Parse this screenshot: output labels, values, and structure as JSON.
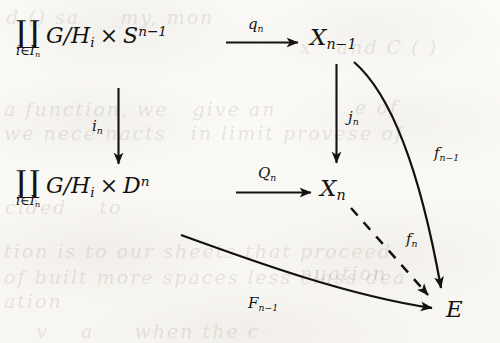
{
  "figure": {
    "kind": "commutative-diagram",
    "background_color": "#fbfaf7",
    "ink_color": "#14120f"
  },
  "nodes": [
    {
      "id": "top-left",
      "name": "node-coproduct-sphere",
      "coproduct_symbol": "∐",
      "coproduct_index": "i∈Iₙ",
      "index_base": "i∈I",
      "index_sub": "n",
      "body_main": "G/H",
      "body_sub": "i",
      "times": "×",
      "space": "S",
      "space_sup": "n−1",
      "text": "∐ i∈Iₙ G/Hᵢ × Sⁿ⁻¹"
    },
    {
      "id": "top-right",
      "name": "node-x-n-minus-1",
      "base": "X",
      "sub": "n−1",
      "text": "Xₙ₋₁"
    },
    {
      "id": "bottom-left",
      "name": "node-coproduct-disk",
      "coproduct_symbol": "∐",
      "coproduct_index": "i∈Iₙ",
      "index_base": "i∈I",
      "index_sub": "n",
      "body_main": "G/H",
      "body_sub": "i",
      "times": "×",
      "space": "D",
      "space_sup": "n",
      "text": "∐ i∈Iₙ G/Hᵢ × Dⁿ"
    },
    {
      "id": "bottom-right",
      "name": "node-x-n",
      "base": "X",
      "sub": "n",
      "text": "Xₙ"
    },
    {
      "id": "target",
      "name": "node-e",
      "base": "E",
      "text": "E"
    }
  ],
  "arrows": [
    {
      "id": "q-n",
      "name": "arrow-q-n",
      "from": "top-left",
      "to": "top-right",
      "style": "solid",
      "shape": "straight",
      "label_base": "q",
      "label_sub": "n",
      "label": "qₙ"
    },
    {
      "id": "i-n",
      "name": "arrow-i-n",
      "from": "top-left",
      "to": "bottom-left",
      "style": "solid",
      "shape": "straight",
      "label_base": "i",
      "label_sub": "n",
      "label": "iₙ"
    },
    {
      "id": "j-n",
      "name": "arrow-j-n",
      "from": "top-right",
      "to": "bottom-right",
      "style": "solid",
      "shape": "straight",
      "label_base": "j",
      "label_sub": "n",
      "label": "jₙ"
    },
    {
      "id": "Q-n",
      "name": "arrow-capital-q-n",
      "from": "bottom-left",
      "to": "bottom-right",
      "style": "solid",
      "shape": "straight",
      "label_base": "Q",
      "label_sub": "n",
      "label": "Qₙ"
    },
    {
      "id": "f-n-minus-1",
      "name": "arrow-f-n-minus-1",
      "from": "top-right",
      "to": "target",
      "style": "solid",
      "shape": "curved",
      "label_base": "f",
      "label_sub": "n−1",
      "label": "fₙ₋₁"
    },
    {
      "id": "f-n",
      "name": "arrow-f-n-dashed",
      "from": "bottom-right",
      "to": "target",
      "style": "dashed",
      "shape": "straight",
      "label_base": "f",
      "label_sub": "n",
      "label": "fₙ"
    },
    {
      "id": "F-n-minus-1",
      "name": "arrow-capital-f-n-minus-1",
      "from": "bottom-left",
      "to": "target",
      "style": "solid",
      "shape": "curved",
      "label_base": "F",
      "label_sub": "n−1",
      "label": "Fₙ₋₁"
    }
  ]
}
